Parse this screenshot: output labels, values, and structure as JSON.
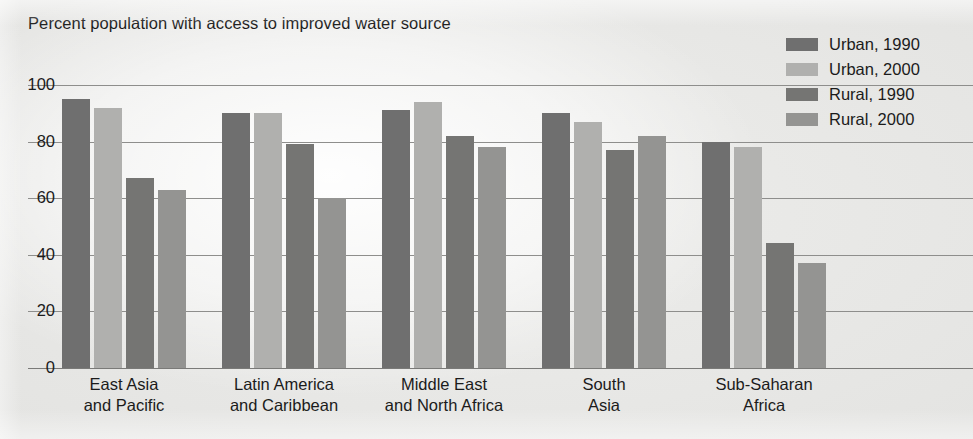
{
  "title": "Percent population with access to improved water source",
  "legend": {
    "position": "top-right",
    "entries": [
      {
        "label": "Urban, 1990",
        "color": "#6f6f6f"
      },
      {
        "label": "Urban, 2000",
        "color": "#b0b0ae"
      },
      {
        "label": "Rural, 1990",
        "color": "#757573"
      },
      {
        "label": "Rural, 2000",
        "color": "#949492"
      }
    ]
  },
  "axis": {
    "yticks": [
      "100",
      "80",
      "60",
      "40",
      "20",
      "0"
    ],
    "ylim": [
      0,
      100
    ],
    "ylabel": "",
    "xlabel": ""
  },
  "categories_wrapped": [
    {
      "l1": "East Asia",
      "l2": "and Pacific"
    },
    {
      "l1": "Latin America",
      "l2": "and Caribbean"
    },
    {
      "l1": "Middle East",
      "l2": "and North Africa"
    },
    {
      "l1": "South",
      "l2": "Asia"
    },
    {
      "l1": "Sub-Saharan",
      "l2": "Africa"
    }
  ],
  "chart_data": {
    "type": "bar",
    "title": "Percent population with access to improved water source",
    "xlabel": "",
    "ylabel": "Percent",
    "ylim": [
      0,
      100
    ],
    "yticks": [
      0,
      20,
      40,
      60,
      80,
      100
    ],
    "grid": true,
    "legend_position": "top-right",
    "categories": [
      "East Asia and Pacific",
      "Latin America and Caribbean",
      "Middle East and North Africa",
      "South Asia",
      "Sub-Saharan Africa"
    ],
    "series": [
      {
        "name": "Urban, 1990",
        "color": "#6f6f6f",
        "values": [
          95,
          90,
          91,
          90,
          80
        ]
      },
      {
        "name": "Urban, 2000",
        "color": "#b0b0ae",
        "values": [
          92,
          90,
          94,
          87,
          78
        ]
      },
      {
        "name": "Rural, 1990",
        "color": "#757573",
        "values": [
          67,
          79,
          82,
          77,
          44
        ]
      },
      {
        "name": "Rural, 2000",
        "color": "#949492",
        "values": [
          63,
          60,
          78,
          82,
          37
        ]
      }
    ]
  },
  "layout": {
    "plot_top_px": 80,
    "plot_height_px": 292,
    "baseline_y_px": 288,
    "value100_y_px": 5,
    "group_starts_px": [
      62,
      222,
      382,
      542,
      702
    ],
    "bar_width_px": 28,
    "bar_pitch_px": 32,
    "group_label_centers_px": [
      124,
      284,
      444,
      604,
      764
    ]
  }
}
